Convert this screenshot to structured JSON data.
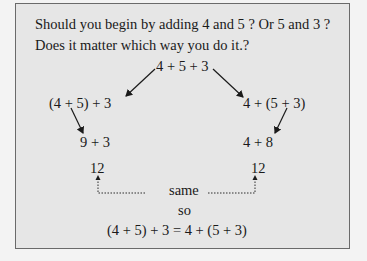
{
  "question": {
    "line1": "Should you begin by adding 4 and 5 ? Or 5 and 3 ?",
    "line2": "Does it matter which way you do it.?"
  },
  "diagram": {
    "top": "4 + 5 + 3",
    "left_group": "(4 + 5) + 3",
    "right_group": "4 + (5 + 3)",
    "left_step": "9 + 3",
    "right_step": "4 + 8",
    "left_result": "12",
    "right_result": "12",
    "same_label": "same",
    "so_label": "so",
    "conclusion": "(4 + 5) + 3 = 4 + (5 + 3)"
  }
}
